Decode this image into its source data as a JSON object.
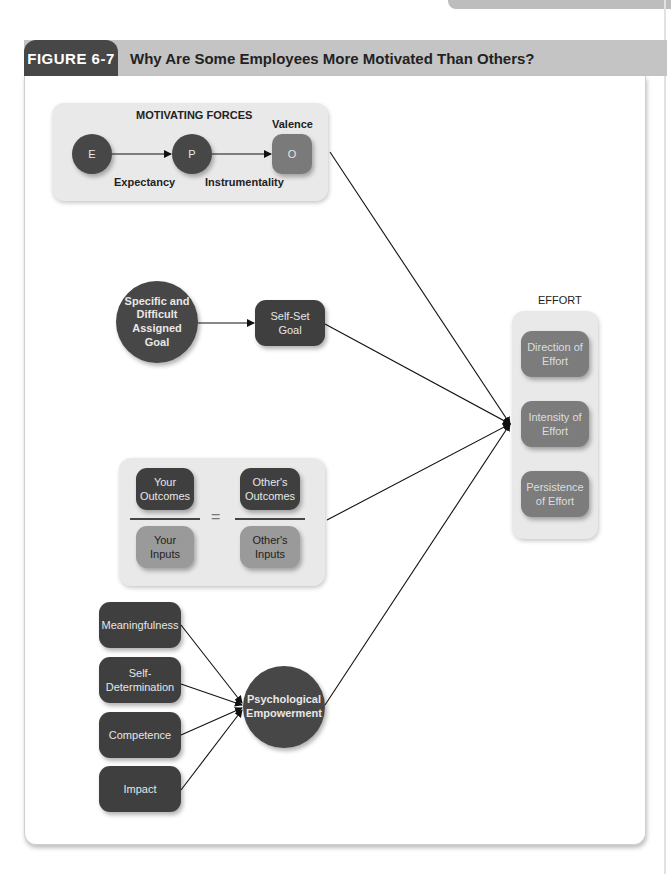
{
  "figure": {
    "number": "FIGURE 6-7",
    "title": "Why Are Some Employees More Motivated Than Others?"
  },
  "motivating_forces": {
    "heading": "MOTIVATING FORCES",
    "nodes": {
      "e": "E",
      "p": "P",
      "o": "O"
    },
    "valence_label": "Valence",
    "expectancy_label": "Expectancy",
    "instrumentality_label": "Instrumentality"
  },
  "goal_setting": {
    "assigned_goal": "Specific and Difficult Assigned Goal",
    "self_set_goal": "Self-Set Goal"
  },
  "equity": {
    "your_outcomes": "Your Outcomes",
    "your_inputs": "Your Inputs",
    "others_outcomes": "Other's Outcomes",
    "others_inputs": "Other's Inputs",
    "equals": "="
  },
  "empowerment": {
    "items": [
      "Meaningfulness",
      "Self-Determination",
      "Competence",
      "Impact"
    ],
    "center": "Psychological Empowerment"
  },
  "effort": {
    "heading": "EFFORT",
    "items": [
      "Direction of Effort",
      "Intensity of Effort",
      "Persistence of Effort"
    ]
  }
}
